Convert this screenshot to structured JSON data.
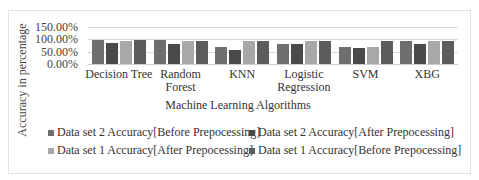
{
  "chart_data": {
    "type": "bar",
    "title": "",
    "xlabel": "Machine Learning Algorithms",
    "ylabel": "Accuracy in percentage",
    "ylim": [
      0,
      150
    ],
    "yticks": [
      "150.00%",
      "100.00%",
      "50.00%",
      "0.00%"
    ],
    "grid": true,
    "legend_position": "bottom",
    "categories": [
      "Decision Tree",
      "Random Forest",
      "KNN",
      "Logistic Regression",
      "SVM",
      "XBG"
    ],
    "category_lines": [
      [
        "Decision Tree"
      ],
      [
        "Random",
        "Forest"
      ],
      [
        "KNN"
      ],
      [
        "Logistic",
        "Regression"
      ],
      [
        "SVM"
      ],
      [
        "XBG"
      ]
    ],
    "series": [
      {
        "name": "Data set 2 Accuracy[Before Prepocessing]",
        "color": "#6f6f6f",
        "values": [
          97,
          98,
          68,
          83,
          70,
          92
        ]
      },
      {
        "name": "Data set 2 Accuracy[After Prepocessing]",
        "color": "#4a4a4a",
        "values": [
          84,
          83,
          58,
          83,
          63,
          83
        ]
      },
      {
        "name": "Data set 1 Accuracy[After Prepocessing]",
        "color": "#a8a8a8",
        "values": [
          95,
          93,
          93,
          95,
          68,
          93
        ]
      },
      {
        "name": "Data set 1 Accuracy[Before Prepocessing]",
        "color": "#5c5c5c",
        "values": [
          97,
          93,
          93,
          95,
          95,
          93
        ]
      }
    ]
  }
}
